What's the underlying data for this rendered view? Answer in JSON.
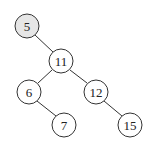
{
  "diagram": {
    "type": "binary-search-tree",
    "nodes": [
      {
        "id": "n5",
        "label": "5",
        "x": 27,
        "y": 26,
        "highlighted": true
      },
      {
        "id": "n11",
        "label": "11",
        "x": 61,
        "y": 61,
        "highlighted": false
      },
      {
        "id": "n6",
        "label": "6",
        "x": 29,
        "y": 92,
        "highlighted": false
      },
      {
        "id": "n12",
        "label": "12",
        "x": 96,
        "y": 92,
        "highlighted": false
      },
      {
        "id": "n7",
        "label": "7",
        "x": 64,
        "y": 125,
        "highlighted": false
      },
      {
        "id": "n15",
        "label": "15",
        "x": 130,
        "y": 125,
        "highlighted": false
      }
    ],
    "edges": [
      {
        "from": "n5",
        "to": "n11"
      },
      {
        "from": "n11",
        "to": "n6"
      },
      {
        "from": "n11",
        "to": "n12"
      },
      {
        "from": "n6",
        "to": "n7"
      },
      {
        "from": "n12",
        "to": "n15"
      }
    ],
    "colors": {
      "stroke": "#333333",
      "highlight_fill": "#e6e6e6",
      "fill": "#ffffff"
    }
  }
}
